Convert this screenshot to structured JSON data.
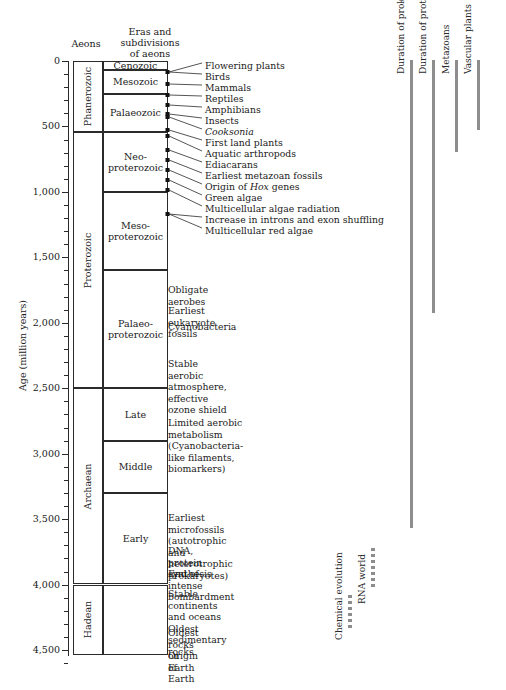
{
  "headers": {
    "aeons": "Aeons",
    "eras": "Eras and\nsubdivisions\nof aeons"
  },
  "axis": {
    "title": "Age (million years)",
    "unit": "million years",
    "min": 0,
    "max": 4500,
    "major_ticks": [
      "0",
      "500",
      "1,000",
      "1,500",
      "2,000",
      "2,500",
      "3,000",
      "3,500",
      "4,000",
      "4,500"
    ],
    "major_values": [
      0,
      500,
      1000,
      1500,
      2000,
      2500,
      3000,
      3500,
      4000,
      4500
    ],
    "minor_interval": 100
  },
  "aeons": [
    {
      "name": "Phanerozoic",
      "start": 0,
      "end": 542
    },
    {
      "name": "Proterozoic",
      "start": 542,
      "end": 2500
    },
    {
      "name": "Archaean",
      "start": 2500,
      "end": 4000
    },
    {
      "name": "Hadean",
      "start": 4000,
      "end": 4600
    }
  ],
  "eras": [
    {
      "name": "Cenozoic",
      "start": 0,
      "end": 65
    },
    {
      "name": "Mesozoic",
      "start": 65,
      "end": 251
    },
    {
      "name": "Palaeozoic",
      "start": 251,
      "end": 542
    },
    {
      "name": "Neo-\nproterozoic",
      "start": 542,
      "end": 1000
    },
    {
      "name": "Meso-\nproterozoic",
      "start": 1000,
      "end": 1600
    },
    {
      "name": "",
      "start": 1600,
      "end": 2500
    },
    {
      "name": "Late",
      "start": 2500,
      "end": 2900
    },
    {
      "name": "Middle",
      "start": 2900,
      "end": 3300
    },
    {
      "name": "Early",
      "start": 3300,
      "end": 4000
    },
    {
      "name": "",
      "start": 4000,
      "end": 4600
    }
  ],
  "palaeoproterozoic_label": "Palaeo-\nproterozoic",
  "events_fanned": [
    {
      "label": "Flowering plants",
      "label_y": 66,
      "dot_y": 72
    },
    {
      "label": "Birds",
      "label_y": 77,
      "dot_y": 72
    },
    {
      "label": "Mammals",
      "label_y": 88,
      "dot_y": 84
    },
    {
      "label": "Reptiles",
      "label_y": 99,
      "dot_y": 95
    },
    {
      "label": "Amphibians",
      "label_y": 110,
      "dot_y": 105
    },
    {
      "label": "Insects",
      "label_y": 121,
      "dot_y": 114
    },
    {
      "label": "Cooksonia",
      "label_y": 132,
      "dot_y": 117,
      "italic": true
    },
    {
      "label": "First land plants",
      "label_y": 143,
      "dot_y": 130
    },
    {
      "label": "Aquatic arthropods",
      "label_y": 154,
      "dot_y": 136
    },
    {
      "label": "Ediacarans",
      "label_y": 165,
      "dot_y": 150
    },
    {
      "label": "Earliest metazoan fossils",
      "label_y": 176,
      "dot_y": 160
    },
    {
      "label": "Origin of Hox genes",
      "label_y": 187,
      "dot_y": 170,
      "italic_word": "Hox"
    },
    {
      "label": "Green algae",
      "label_y": 198,
      "dot_y": 180
    },
    {
      "label": "Multicellular algae radiation",
      "label_y": 209,
      "dot_y": 190
    },
    {
      "label": "Increase in introns and exon shuffling",
      "label_y": 220,
      "dot_y": 214
    },
    {
      "label": "Multicellular red algae",
      "label_y": 231,
      "dot_y": 214
    }
  ],
  "events_plain": [
    {
      "label": "Obligate aerobes",
      "y": 290
    },
    {
      "label": "Earliest eukaryote fossils",
      "y": 311
    },
    {
      "label": "Cyanobacteria",
      "y": 327
    },
    {
      "label": "Stable aerobic atmosphere,\neffective ozone shield",
      "y": 364
    },
    {
      "label": "Limited aerobic metabolism\n(Cyanobacteria-like filaments, biomarkers)",
      "y": 423
    },
    {
      "label": "Earliest microfossils (autotrophic\nand heterotrophic prokaryotes)",
      "y": 518
    },
    {
      "label": "DNA, protein synthesis",
      "y": 551
    },
    {
      "label": "End of intense bombardment",
      "y": 574
    },
    {
      "label": "Stable continents and oceans\nOldest sedimentary rocks",
      "y": 594
    },
    {
      "label": "Oldest rocks on Earth",
      "y": 633
    },
    {
      "label": "Origin of Earth",
      "y": 656
    }
  ],
  "duration_bars": [
    {
      "label": "Duration of prokaryotes",
      "x": 410,
      "top": 60,
      "bottom": 528,
      "color": "#8d8d8d"
    },
    {
      "label": "Duration of protists",
      "x": 432,
      "top": 60,
      "bottom": 313,
      "color": "#8d8d8d"
    },
    {
      "label": "Metazoans",
      "x": 455,
      "top": 60,
      "bottom": 152,
      "color": "#8d8d8d"
    },
    {
      "label": "Vascular plants",
      "x": 477,
      "top": 60,
      "bottom": 130,
      "color": "#8d8d8d"
    }
  ],
  "dotted_bars": [
    {
      "label": "Chemical evolution",
      "x": 348,
      "top": 595,
      "bottom": 628,
      "color": "#8d8d8d"
    },
    {
      "label": "RNA world",
      "x": 371,
      "top": 548,
      "bottom": 592,
      "color": "#8d8d8d"
    }
  ]
}
